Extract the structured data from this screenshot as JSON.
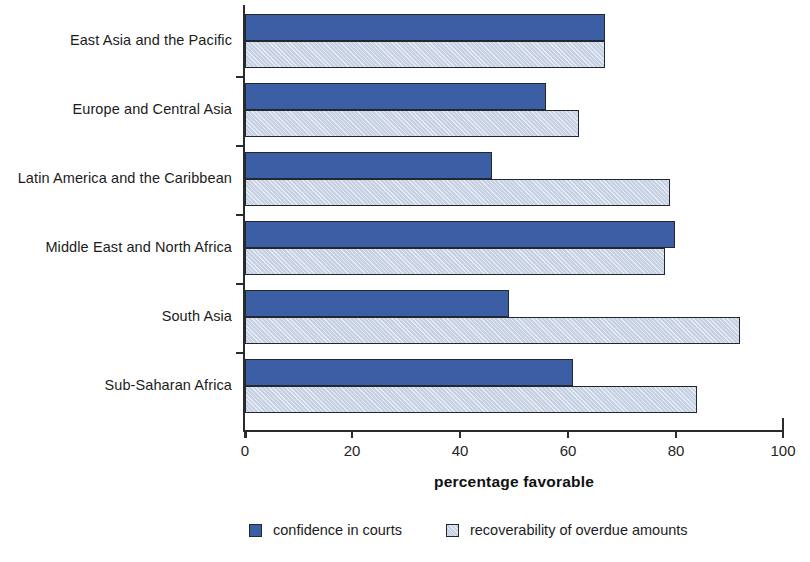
{
  "chart_data": {
    "type": "bar",
    "orientation": "horizontal",
    "title": "",
    "xlabel": "percentage favorable",
    "ylabel": "",
    "xlim": [
      0,
      100
    ],
    "xticks": [
      "0",
      "20",
      "40",
      "60",
      "80",
      "100"
    ],
    "grid": false,
    "legend_position": "bottom",
    "categories": [
      "East Asia and the Pacific",
      "Europe and Central Asia",
      "Latin America and the Caribbean",
      "Middle East and North Africa",
      "South Asia",
      "Sub-Saharan Africa"
    ],
    "series": [
      {
        "name": "confidence in courts",
        "color": "#3c5ea4",
        "values": [
          67,
          56,
          46,
          80,
          49,
          61
        ]
      },
      {
        "name": "recoverability of overdue amounts",
        "color": "#c7d1e4",
        "values": [
          67,
          62,
          79,
          78,
          92,
          84
        ]
      }
    ]
  },
  "axis": {
    "x_title": "percentage favorable"
  }
}
